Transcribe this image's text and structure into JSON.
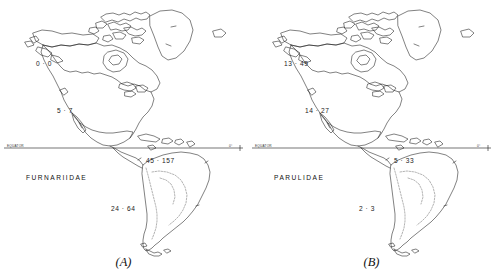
{
  "figure": {
    "panels": [
      {
        "id": "A",
        "caption": "(A)",
        "family_label": "FURNARIIDAE",
        "equator_left_label": "EQUATOR",
        "equator_right_label": "0°",
        "counts": [
          {
            "name": "north-america-west",
            "value": "0 · 0"
          },
          {
            "name": "north-america-south",
            "value": "5 · 7"
          },
          {
            "name": "south-america-north",
            "value": "45 · 157"
          },
          {
            "name": "south-america-south",
            "value": "24 · 64"
          }
        ]
      },
      {
        "id": "B",
        "caption": "(B)",
        "family_label": "PARULIDAE",
        "equator_left_label": "EQUATOR",
        "equator_right_label": "0°",
        "counts": [
          {
            "name": "north-america-west",
            "value": "13 · 49"
          },
          {
            "name": "north-america-south",
            "value": "14 · 27"
          },
          {
            "name": "south-america-north",
            "value": "5 · 33"
          },
          {
            "name": "south-america-south",
            "value": "2 · 3"
          }
        ]
      }
    ],
    "colors": {
      "background": "#ffffff",
      "coastline": "#1a1a1a",
      "interior_dashed": "#555555",
      "text": "#111111"
    }
  }
}
